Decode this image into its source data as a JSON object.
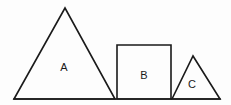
{
  "diagram": {
    "background_color": "#fdfdfd",
    "stroke_color": "#1a1a1a",
    "label_color": "#1a1a1a",
    "baseline": {
      "name": "ground-line",
      "x1": 14,
      "y1": 99,
      "x2": 220,
      "y2": 99
    },
    "shapes": [
      {
        "id": "A",
        "label": "A",
        "type": "triangle",
        "points": "14,99 65,8 115,99",
        "label_x": 64,
        "label_y": 68
      },
      {
        "id": "B",
        "label": "B",
        "type": "square",
        "points": "117,45 171,45 171,99 117,99",
        "label_x": 144,
        "label_y": 76
      },
      {
        "id": "C",
        "label": "C",
        "type": "triangle",
        "points": "172,99 193,56 220,99",
        "label_x": 192,
        "label_y": 85
      }
    ]
  }
}
